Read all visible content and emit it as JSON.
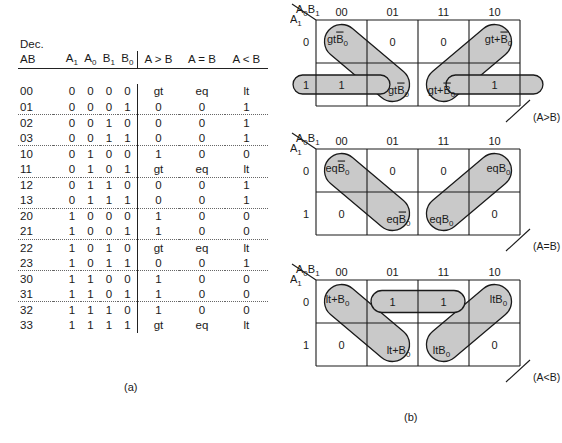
{
  "figure": {
    "part_a_label": "(a)",
    "part_b_label": "(b)"
  },
  "truth_table": {
    "dec_label": "Dec.",
    "headers": {
      "ab": "AB",
      "bits": [
        "A",
        "A",
        "B",
        "B"
      ],
      "bit_subs": [
        "1",
        "0",
        "1",
        "0"
      ],
      "outputs": [
        "A > B",
        "A = B",
        "A < B"
      ]
    },
    "rows": [
      {
        "ab": "00",
        "bits": [
          "0",
          "0",
          "0",
          "0"
        ],
        "out": [
          "gt",
          "eq",
          "lt"
        ],
        "dotted": false
      },
      {
        "ab": "01",
        "bits": [
          "0",
          "0",
          "0",
          "1"
        ],
        "out": [
          "0",
          "0",
          "1"
        ],
        "dotted": true
      },
      {
        "ab": "02",
        "bits": [
          "0",
          "0",
          "1",
          "0"
        ],
        "out": [
          "0",
          "0",
          "1"
        ],
        "dotted": false
      },
      {
        "ab": "03",
        "bits": [
          "0",
          "0",
          "1",
          "1"
        ],
        "out": [
          "0",
          "0",
          "1"
        ],
        "dotted": true
      },
      {
        "ab": "10",
        "bits": [
          "0",
          "1",
          "0",
          "0"
        ],
        "out": [
          "1",
          "0",
          "0"
        ],
        "dotted": false
      },
      {
        "ab": "11",
        "bits": [
          "0",
          "1",
          "0",
          "1"
        ],
        "out": [
          "gt",
          "eq",
          "lt"
        ],
        "dotted": true
      },
      {
        "ab": "12",
        "bits": [
          "0",
          "1",
          "1",
          "0"
        ],
        "out": [
          "0",
          "0",
          "1"
        ],
        "dotted": false
      },
      {
        "ab": "13",
        "bits": [
          "0",
          "1",
          "1",
          "1"
        ],
        "out": [
          "0",
          "0",
          "1"
        ],
        "dotted": true
      },
      {
        "ab": "20",
        "bits": [
          "1",
          "0",
          "0",
          "0"
        ],
        "out": [
          "1",
          "0",
          "0"
        ],
        "dotted": false
      },
      {
        "ab": "21",
        "bits": [
          "1",
          "0",
          "0",
          "1"
        ],
        "out": [
          "1",
          "0",
          "0"
        ],
        "dotted": true
      },
      {
        "ab": "22",
        "bits": [
          "1",
          "0",
          "1",
          "0"
        ],
        "out": [
          "gt",
          "eq",
          "lt"
        ],
        "dotted": false
      },
      {
        "ab": "23",
        "bits": [
          "1",
          "0",
          "1",
          "1"
        ],
        "out": [
          "0",
          "0",
          "1"
        ],
        "dotted": true
      },
      {
        "ab": "30",
        "bits": [
          "1",
          "1",
          "0",
          "0"
        ],
        "out": [
          "1",
          "0",
          "0"
        ],
        "dotted": false
      },
      {
        "ab": "31",
        "bits": [
          "1",
          "1",
          "0",
          "1"
        ],
        "out": [
          "1",
          "0",
          "0"
        ],
        "dotted": true
      },
      {
        "ab": "32",
        "bits": [
          "1",
          "1",
          "1",
          "0"
        ],
        "out": [
          "1",
          "0",
          "0"
        ],
        "dotted": false
      },
      {
        "ab": "33",
        "bits": [
          "1",
          "1",
          "1",
          "1"
        ],
        "out": [
          "gt",
          "eq",
          "lt"
        ],
        "dotted": false
      }
    ]
  },
  "kmaps": [
    {
      "id": "gt",
      "axis_top": "A₀B₁",
      "axis_left": "A₁",
      "col_headers": [
        "00",
        "01",
        "11",
        "10"
      ],
      "row_headers": [
        "0",
        "1"
      ],
      "output_label": "(A>B)",
      "cells": {
        "row0": [
          "gtĀB₀",
          "0",
          "0",
          "gt+ĀB₀"
        ],
        "row1": [
          "1",
          "gtĀB₀",
          "gt+ĀB₀",
          "1"
        ]
      },
      "cell_text": [
        {
          "r": 0,
          "c": 0,
          "text": "gt",
          "over": "B",
          "sub": "0",
          "shaded": true
        },
        {
          "r": 0,
          "c": 1,
          "text": "0",
          "shaded": false
        },
        {
          "r": 0,
          "c": 2,
          "text": "0",
          "shaded": false
        },
        {
          "r": 0,
          "c": 3,
          "text": "gt+",
          "over": "B",
          "sub": "0",
          "shaded": true
        },
        {
          "r": 1,
          "c": 0,
          "text": "1",
          "shaded": true
        },
        {
          "r": 1,
          "c": 1,
          "text": "gt",
          "over": "B",
          "sub": "0",
          "shaded": true
        },
        {
          "r": 1,
          "c": 2,
          "text": "gt+",
          "over": "B",
          "sub": "0",
          "shaded": true
        },
        {
          "r": 1,
          "c": 3,
          "text": "1",
          "shaded": true
        }
      ]
    },
    {
      "id": "eq",
      "axis_top": "A₀B₁",
      "axis_left": "A₁",
      "col_headers": [
        "00",
        "01",
        "11",
        "10"
      ],
      "row_headers": [
        "0",
        "1"
      ],
      "output_label": "(A=B)",
      "cell_text": [
        {
          "r": 0,
          "c": 0,
          "text": "eq",
          "over": "B",
          "sub": "0",
          "shaded": true
        },
        {
          "r": 0,
          "c": 1,
          "text": "0",
          "shaded": false
        },
        {
          "r": 0,
          "c": 2,
          "text": "0",
          "shaded": false
        },
        {
          "r": 0,
          "c": 3,
          "text": "eqB",
          "over": "",
          "sub": "0",
          "shaded": true
        },
        {
          "r": 1,
          "c": 0,
          "text": "0",
          "shaded": false
        },
        {
          "r": 1,
          "c": 1,
          "text": "eq",
          "over": "B",
          "sub": "0",
          "shaded": true
        },
        {
          "r": 1,
          "c": 2,
          "text": "eqB",
          "over": "",
          "sub": "0",
          "shaded": true
        },
        {
          "r": 1,
          "c": 3,
          "text": "0",
          "shaded": false
        }
      ]
    },
    {
      "id": "lt",
      "axis_top": "A₀B₁",
      "axis_left": "A₁",
      "col_headers": [
        "00",
        "01",
        "11",
        "10"
      ],
      "row_headers": [
        "0",
        "1"
      ],
      "output_label": "(A<B)",
      "cell_text": [
        {
          "r": 0,
          "c": 0,
          "text": "lt+B",
          "over": "",
          "sub": "0",
          "shaded": true
        },
        {
          "r": 0,
          "c": 1,
          "text": "1",
          "shaded": true
        },
        {
          "r": 0,
          "c": 2,
          "text": "1",
          "shaded": true
        },
        {
          "r": 0,
          "c": 3,
          "text": "ltB",
          "over": "",
          "sub": "0",
          "shaded": true
        },
        {
          "r": 1,
          "c": 0,
          "text": "0",
          "shaded": false
        },
        {
          "r": 1,
          "c": 1,
          "text": "lt+B",
          "over": "",
          "sub": "0",
          "shaded": true
        },
        {
          "r": 1,
          "c": 2,
          "text": "ltB",
          "over": "",
          "sub": "0",
          "shaded": true
        },
        {
          "r": 1,
          "c": 3,
          "text": "0",
          "shaded": false
        }
      ]
    }
  ],
  "colors": {
    "shade": "#c9c9c9",
    "line": "#1a1a1a",
    "background": "#ffffff"
  }
}
